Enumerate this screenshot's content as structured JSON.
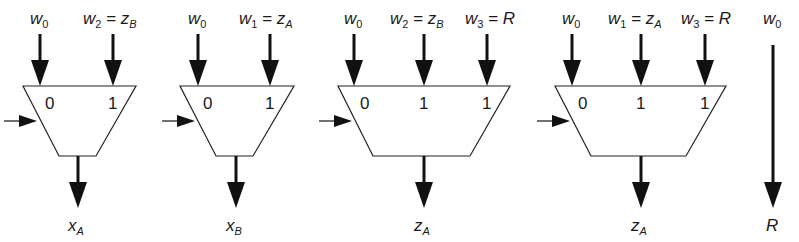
{
  "diagram": {
    "type": "multiplexer-configurations",
    "muxes": [
      {
        "id": "mux-1",
        "inputs": [
          {
            "var": "w",
            "sub": "0",
            "eq": "",
            "rhs": "",
            "rhs_sub": "",
            "select": "0"
          },
          {
            "var": "w",
            "sub": "2",
            "eq": " = ",
            "rhs": "z",
            "rhs_sub": "B",
            "select": "1"
          }
        ],
        "output": {
          "var": "x",
          "sub": "A"
        }
      },
      {
        "id": "mux-2",
        "inputs": [
          {
            "var": "w",
            "sub": "0",
            "eq": "",
            "rhs": "",
            "rhs_sub": "",
            "select": "0"
          },
          {
            "var": "w",
            "sub": "1",
            "eq": " = ",
            "rhs": "z",
            "rhs_sub": "A",
            "select": "1"
          }
        ],
        "output": {
          "var": "x",
          "sub": "B"
        }
      },
      {
        "id": "mux-3",
        "inputs": [
          {
            "var": "w",
            "sub": "0",
            "eq": "",
            "rhs": "",
            "rhs_sub": "",
            "select": "0"
          },
          {
            "var": "w",
            "sub": "2",
            "eq": " = ",
            "rhs": "z",
            "rhs_sub": "B",
            "select": "1"
          },
          {
            "var": "w",
            "sub": "3",
            "eq": " = ",
            "rhs": "R",
            "rhs_sub": "",
            "select": "1"
          }
        ],
        "output": {
          "var": "z",
          "sub": "A"
        }
      },
      {
        "id": "mux-4",
        "inputs": [
          {
            "var": "w",
            "sub": "0",
            "eq": "",
            "rhs": "",
            "rhs_sub": "",
            "select": "0"
          },
          {
            "var": "w",
            "sub": "1",
            "eq": " = ",
            "rhs": "z",
            "rhs_sub": "A",
            "select": "1"
          },
          {
            "var": "w",
            "sub": "3",
            "eq": " = ",
            "rhs": "R",
            "rhs_sub": "",
            "select": "1"
          }
        ],
        "output": {
          "var": "z",
          "sub": "A"
        }
      }
    ],
    "passthrough": {
      "input": {
        "var": "w",
        "sub": "0"
      },
      "output": {
        "var": "R",
        "sub": ""
      }
    },
    "colors": {
      "stroke": "#111111",
      "fill": "#ffffff",
      "background": "#ffffff"
    }
  }
}
